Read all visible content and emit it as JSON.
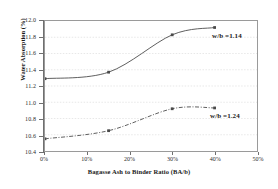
{
  "chart_data": {
    "type": "line",
    "title": "",
    "xlabel": "Bagasse Ash to Binder Ratio (BA/b)",
    "ylabel": "Water Absorption (%)",
    "xlim": [
      0,
      50
    ],
    "ylim": [
      10.4,
      12.0
    ],
    "xticks": [
      "0%",
      "10%",
      "20%",
      "30%",
      "40%",
      "50%"
    ],
    "xtick_values": [
      0,
      10,
      20,
      30,
      40,
      50
    ],
    "yticks": [
      "10.4",
      "10.6",
      "10.8",
      "11.0",
      "11.2",
      "11.4",
      "11.6",
      "11.8",
      "12.0"
    ],
    "ytick_values": [
      10.4,
      10.6,
      10.8,
      11.0,
      11.2,
      11.4,
      11.6,
      11.8,
      12.0
    ],
    "grid": "horizontal-light",
    "legend_position": "inline-right-of-series",
    "series": [
      {
        "name": "w/b = 1.14",
        "annotation": "w/b =1.14",
        "style": "solid",
        "color": "#4a4a4a",
        "x": [
          0,
          15,
          30,
          40
        ],
        "values": [
          11.29,
          11.37,
          11.83,
          11.92
        ]
      },
      {
        "name": "w/b = 1.24",
        "annotation": "w/b =1.24",
        "style": "dash-dot",
        "color": "#4a4a4a",
        "x": [
          0,
          15,
          30,
          40
        ],
        "values": [
          10.55,
          10.65,
          10.92,
          10.93
        ]
      }
    ]
  }
}
